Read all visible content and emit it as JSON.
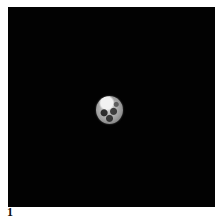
{
  "figure": {
    "label": "1",
    "background_color": "#020202"
  }
}
